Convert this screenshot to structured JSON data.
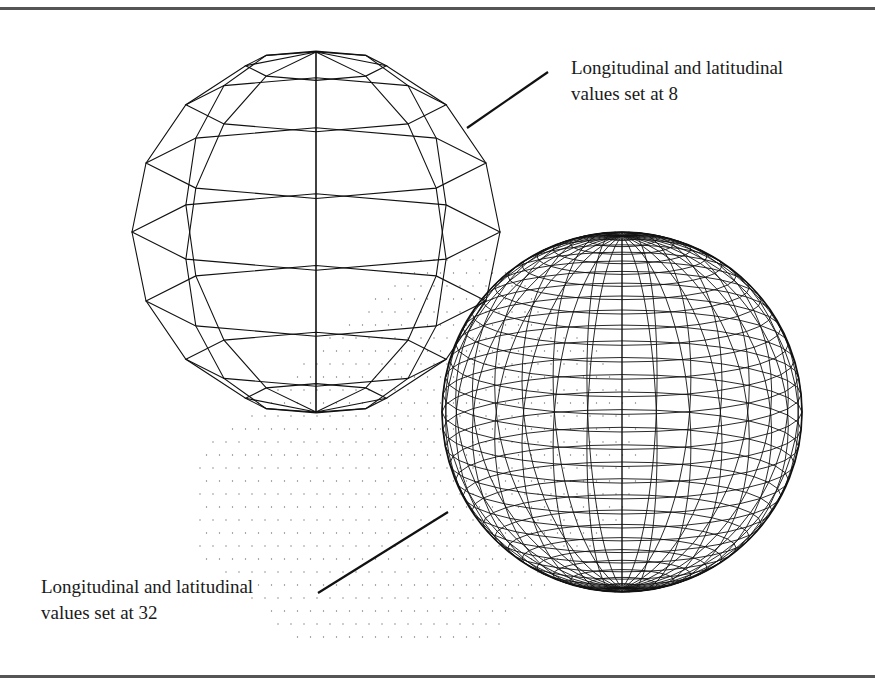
{
  "figure": {
    "labels": {
      "low_res": {
        "line1": "Longitudinal and latitudinal",
        "line2": "values set at 8"
      },
      "high_res": {
        "line1": "Longitudinal and latitudinal",
        "line2": "values set at 32"
      }
    },
    "colors": {
      "line": "#111111",
      "rule": "#555555",
      "dots": "#777777",
      "background": "#ffffff"
    },
    "spheres": [
      {
        "id": "sphere-8",
        "cx": 316,
        "cy": 232,
        "r": 184,
        "longitudes": 8,
        "latitudes": 8,
        "tilt_deg": 12,
        "stroke": 1.1
      },
      {
        "id": "sphere-32",
        "cx": 622,
        "cy": 412,
        "r": 180,
        "longitudes": 32,
        "latitudes": 32,
        "tilt_deg": 12,
        "stroke": 0.9
      }
    ],
    "leaders": [
      {
        "id": "leader-8",
        "x1": 467,
        "y1": 128,
        "x2": 548,
        "y2": 72
      },
      {
        "id": "leader-32",
        "x1": 318,
        "y1": 593,
        "x2": 448,
        "y2": 512
      }
    ],
    "dot_grid": {
      "origin_x": 200,
      "origin_y": 260,
      "spacing": 13,
      "cols": 34,
      "rows": 30
    }
  }
}
